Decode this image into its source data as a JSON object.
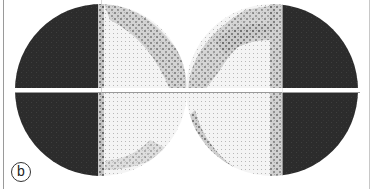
{
  "figure": {
    "panel_label": "b",
    "left_eye": {
      "dark_half": "temporal (left)",
      "center": [
        101,
        90
      ],
      "radius": 86
    },
    "right_eye": {
      "dark_half": "temporal (right)",
      "center": [
        272,
        90
      ],
      "radius": 86
    },
    "colors": {
      "dark": "#2a2a2a",
      "mid": "#8a8a8a",
      "light": "#e6e6e6",
      "background": "#ffffff",
      "meridian": "#ffffff"
    }
  }
}
